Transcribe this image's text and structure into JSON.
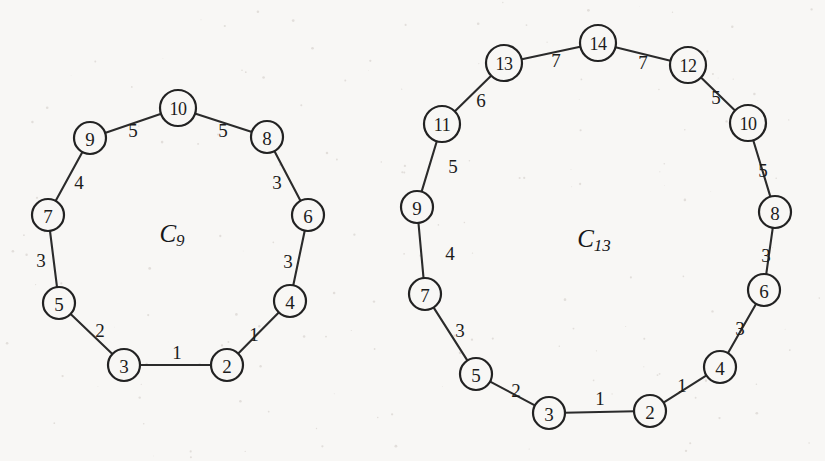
{
  "figure": {
    "background_color": "#f8f7f5",
    "ink_color": "#222222",
    "width": 825,
    "height": 461,
    "graphs": [
      {
        "id": "c9",
        "title_base": "C",
        "title_sub": "9",
        "title_x": 172,
        "title_y": 233,
        "node_radius_single": 16,
        "node_radius_double": 18,
        "nodes": [
          {
            "label": "2",
            "x": 227,
            "y": 365,
            "r": 16
          },
          {
            "label": "3",
            "x": 124,
            "y": 365,
            "r": 16
          },
          {
            "label": "5",
            "x": 59,
            "y": 303,
            "r": 16
          },
          {
            "label": "7",
            "x": 48,
            "y": 215,
            "r": 16
          },
          {
            "label": "9",
            "x": 90,
            "y": 138,
            "r": 16
          },
          {
            "label": "10",
            "x": 178,
            "y": 108,
            "r": 18
          },
          {
            "label": "8",
            "x": 267,
            "y": 137,
            "r": 16
          },
          {
            "label": "6",
            "x": 308,
            "y": 215,
            "r": 16
          },
          {
            "label": "4",
            "x": 290,
            "y": 301,
            "r": 16
          }
        ],
        "edges": [
          {
            "from": 0,
            "to": 1,
            "weight": "1",
            "lx": 177,
            "ly": 352
          },
          {
            "from": 1,
            "to": 2,
            "weight": "2",
            "lx": 100,
            "ly": 330
          },
          {
            "from": 2,
            "to": 3,
            "weight": "3",
            "lx": 41,
            "ly": 260
          },
          {
            "from": 3,
            "to": 4,
            "weight": "4",
            "lx": 79,
            "ly": 182
          },
          {
            "from": 4,
            "to": 5,
            "weight": "5",
            "lx": 133,
            "ly": 130
          },
          {
            "from": 5,
            "to": 6,
            "weight": "5",
            "lx": 223,
            "ly": 130
          },
          {
            "from": 6,
            "to": 7,
            "weight": "3",
            "lx": 277,
            "ly": 182
          },
          {
            "from": 7,
            "to": 8,
            "weight": "3",
            "lx": 288,
            "ly": 261
          },
          {
            "from": 8,
            "to": 0,
            "weight": "1",
            "lx": 254,
            "ly": 334
          }
        ]
      },
      {
        "id": "c13",
        "title_base": "C",
        "title_sub": "13",
        "title_x": 594,
        "title_y": 238,
        "node_radius_single": 16,
        "node_radius_double": 18,
        "nodes": [
          {
            "label": "2",
            "x": 650,
            "y": 411,
            "r": 16
          },
          {
            "label": "3",
            "x": 549,
            "y": 413,
            "r": 16
          },
          {
            "label": "5",
            "x": 476,
            "y": 374,
            "r": 16
          },
          {
            "label": "7",
            "x": 425,
            "y": 294,
            "r": 16
          },
          {
            "label": "9",
            "x": 417,
            "y": 207,
            "r": 16
          },
          {
            "label": "11",
            "x": 442,
            "y": 124,
            "r": 18
          },
          {
            "label": "13",
            "x": 504,
            "y": 63,
            "r": 18
          },
          {
            "label": "14",
            "x": 598,
            "y": 43,
            "r": 18
          },
          {
            "label": "12",
            "x": 688,
            "y": 65,
            "r": 18
          },
          {
            "label": "10",
            "x": 748,
            "y": 123,
            "r": 18
          },
          {
            "label": "8",
            "x": 775,
            "y": 212,
            "r": 16
          },
          {
            "label": "6",
            "x": 764,
            "y": 290,
            "r": 16
          },
          {
            "label": "4",
            "x": 720,
            "y": 367,
            "r": 16
          }
        ],
        "edges": [
          {
            "from": 0,
            "to": 1,
            "weight": "1",
            "lx": 600,
            "ly": 398
          },
          {
            "from": 1,
            "to": 2,
            "weight": "2",
            "lx": 516,
            "ly": 390
          },
          {
            "from": 2,
            "to": 3,
            "weight": "3",
            "lx": 460,
            "ly": 330
          },
          {
            "from": 3,
            "to": 4,
            "weight": "4",
            "lx": 450,
            "ly": 253
          },
          {
            "from": 4,
            "to": 5,
            "weight": "5",
            "lx": 453,
            "ly": 166
          },
          {
            "from": 5,
            "to": 6,
            "weight": "6",
            "lx": 481,
            "ly": 100
          },
          {
            "from": 6,
            "to": 7,
            "weight": "7",
            "lx": 556,
            "ly": 60
          },
          {
            "from": 7,
            "to": 8,
            "weight": "7",
            "lx": 643,
            "ly": 62
          },
          {
            "from": 8,
            "to": 9,
            "weight": "5",
            "lx": 716,
            "ly": 97
          },
          {
            "from": 9,
            "to": 10,
            "weight": "5",
            "lx": 763,
            "ly": 170
          },
          {
            "from": 10,
            "to": 11,
            "weight": "3",
            "lx": 766,
            "ly": 255
          },
          {
            "from": 11,
            "to": 12,
            "weight": "3",
            "lx": 740,
            "ly": 328
          },
          {
            "from": 12,
            "to": 0,
            "weight": "1",
            "lx": 682,
            "ly": 385
          }
        ]
      }
    ]
  }
}
